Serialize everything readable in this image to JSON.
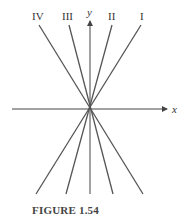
{
  "figure": {
    "caption": "FIGURE 1.54",
    "axes": {
      "x_label": "x",
      "y_label": "y"
    },
    "lines": [
      {
        "label": "IV",
        "x1": 39,
        "y1": 25,
        "x2": 143,
        "y2": 194
      },
      {
        "label": "III",
        "x1": 69,
        "y1": 25,
        "x2": 113,
        "y2": 194
      },
      {
        "label": "II",
        "x1": 112,
        "y1": 25,
        "x2": 66,
        "y2": 194
      },
      {
        "label": "I",
        "x1": 141,
        "y1": 25,
        "x2": 36,
        "y2": 194
      }
    ],
    "colors": {
      "line": "#555555",
      "axis": "#444444",
      "text": "#333333"
    }
  }
}
